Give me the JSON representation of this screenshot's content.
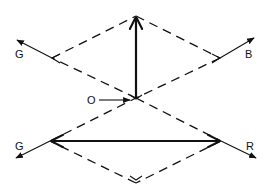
{
  "diagram": {
    "type": "vector diagram",
    "background": "#ffffff",
    "ink_color": "#111111",
    "labels": {
      "top_left": "G",
      "top_right": "B",
      "origin": "O",
      "bottom_left": "G",
      "bottom_right": "R"
    },
    "upper_diamond": {
      "style": "dashed",
      "vertices": [
        [
          136,
          16
        ],
        [
          220,
          58
        ],
        [
          136,
          98
        ],
        [
          52,
          58
        ]
      ]
    },
    "lower_diamond": {
      "style": "dashed",
      "vertices": [
        [
          136,
          98
        ],
        [
          221,
          141
        ],
        [
          136,
          183
        ],
        [
          50,
          141
        ]
      ]
    },
    "vectors": [
      {
        "name": "vertical-resultant",
        "style": "solid-thick",
        "from": [
          136,
          98
        ],
        "to": [
          136,
          16
        ],
        "arrowhead": "end"
      },
      {
        "name": "horizontal-resultant",
        "style": "solid-thick",
        "from": [
          50,
          141
        ],
        "to": [
          221,
          141
        ],
        "arrowhead": "both"
      },
      {
        "name": "G-upper",
        "style": "solid-thin",
        "from": [
          52,
          58
        ],
        "to": [
          16,
          40
        ],
        "label": "G"
      },
      {
        "name": "B",
        "style": "solid-thin",
        "from": [
          220,
          58
        ],
        "to": [
          255,
          38
        ],
        "label": "B"
      },
      {
        "name": "G-lower",
        "style": "solid-thin",
        "from": [
          50,
          141
        ],
        "to": [
          15,
          159
        ],
        "label": "G"
      },
      {
        "name": "R",
        "style": "solid-thin",
        "from": [
          221,
          141
        ],
        "to": [
          257,
          159
        ],
        "label": "R"
      },
      {
        "name": "O-pointer",
        "style": "solid-thin",
        "from": [
          100,
          100
        ],
        "to": [
          130,
          100
        ],
        "label": "O"
      }
    ]
  }
}
